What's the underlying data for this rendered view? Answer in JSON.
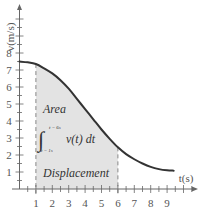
{
  "chart_data": {
    "type": "line",
    "title": "",
    "xlabel": "t(s)",
    "ylabel": "v(m/s)",
    "xlim": [
      0,
      10
    ],
    "ylim": [
      0,
      10.5
    ],
    "x_ticks": [
      "1",
      "2",
      "3",
      "4",
      "5",
      "6",
      "7",
      "8",
      "9"
    ],
    "y_ticks": [
      "1",
      "2",
      "3",
      "4",
      "5",
      "6",
      "7",
      "8"
    ],
    "grid": false,
    "series": [
      {
        "name": "v(t)",
        "x": [
          0,
          0.5,
          1,
          1.5,
          2,
          2.5,
          3,
          3.5,
          4,
          4.5,
          5,
          5.5,
          6,
          6.5,
          7,
          7.5,
          8,
          8.5,
          9,
          9.4
        ],
        "values": [
          7.5,
          7.45,
          7.35,
          7.1,
          6.8,
          6.4,
          5.9,
          5.3,
          4.7,
          4.1,
          3.5,
          2.95,
          2.45,
          2.05,
          1.75,
          1.5,
          1.3,
          1.17,
          1.1,
          1.08
        ]
      }
    ],
    "shaded_region": {
      "from": 1,
      "to": 6,
      "color": "#e3e3e3"
    },
    "annotations": {
      "area": "Area",
      "integral_expr": "v(t) dt",
      "integral_upper": "t = 6s",
      "integral_lower": "t = 1s",
      "displacement": "Displacement"
    }
  },
  "colors": {
    "curve": "#333333",
    "axis": "#666666",
    "shade": "#e3e3e3",
    "dash": "#888888"
  }
}
